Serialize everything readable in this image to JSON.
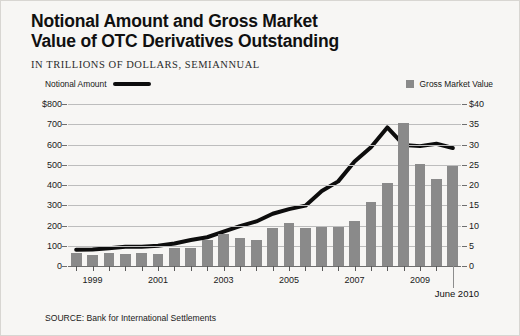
{
  "chart_data": {
    "type": "bar",
    "title": "Notional Amount and Gross Market\nValue of OTC Derivatives Outstanding",
    "subtitle": "IN TRILLIONS OF DOLLARS, SEMIANNUAL",
    "source": "SOURCE: Bank for International Settlements",
    "xlabel": "",
    "ylabel": "",
    "grid": true,
    "legend_position": "top",
    "end_annotation": "June 2010",
    "left_axis": {
      "name": "Notional Amount",
      "ylim": [
        0,
        800
      ],
      "ticks": [
        0,
        100,
        200,
        300,
        400,
        500,
        600,
        700,
        800
      ],
      "tick_labels": [
        "0",
        "100",
        "200",
        "300",
        "400",
        "500",
        "600",
        "700",
        "$800"
      ],
      "color": "#0d0d0d"
    },
    "right_axis": {
      "name": "Gross Market Value",
      "ylim": [
        0,
        40
      ],
      "ticks": [
        0,
        5,
        10,
        15,
        20,
        25,
        30,
        35,
        40
      ],
      "tick_labels": [
        "0",
        "5",
        "10",
        "15",
        "20",
        "25",
        "30",
        "35",
        "$40"
      ],
      "color": "#8a8a8a"
    },
    "categories": [
      "1998 H2",
      "1999 H1",
      "1999 H2",
      "2000 H1",
      "2000 H2",
      "2001 H1",
      "2001 H2",
      "2002 H1",
      "2002 H2",
      "2003 H1",
      "2003 H2",
      "2004 H1",
      "2004 H2",
      "2005 H1",
      "2005 H2",
      "2006 H1",
      "2006 H2",
      "2007 H1",
      "2007 H2",
      "2008 H1",
      "2008 H2",
      "2009 H1",
      "2009 H2",
      "2010 H1"
    ],
    "x_tick_labels": [
      "1999",
      "2001",
      "2003",
      "2005",
      "2007",
      "2009"
    ],
    "x_tick_categories": [
      "1999 H1",
      "2001 H1",
      "2003 H1",
      "2005 H1",
      "2007 H1",
      "2009 H1"
    ],
    "series": [
      {
        "name": "Gross Market Value",
        "type": "bar",
        "axis": "right",
        "color": "#8a8a8a",
        "values": [
          3.2,
          2.8,
          3.2,
          3.0,
          3.2,
          3.0,
          4.4,
          4.5,
          6.4,
          7.9,
          6.9,
          6.4,
          9.4,
          10.6,
          9.3,
          9.6,
          9.7,
          11.1,
          15.8,
          20.4,
          35.3,
          25.3,
          21.5,
          24.7
        ]
      },
      {
        "name": "Notional Amount",
        "type": "line",
        "axis": "left",
        "color": "#0d0d0d",
        "values": [
          80,
          82,
          88,
          95,
          95,
          100,
          111,
          128,
          142,
          170,
          197,
          220,
          258,
          281,
          298,
          370,
          418,
          516,
          586,
          684,
          598,
          592,
          604,
          583
        ]
      }
    ]
  }
}
